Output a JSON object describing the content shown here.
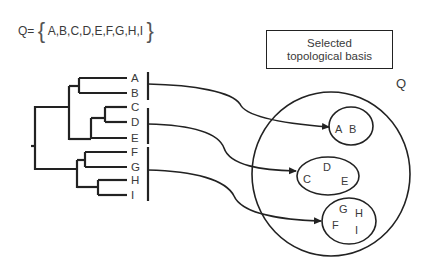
{
  "set_definition": {
    "symbol": "Q=",
    "elements": "A,B,C,D,E,F,G,H,I"
  },
  "basis_box": {
    "line1": "Selected",
    "line2": "topological basis"
  },
  "tree": {
    "leaves": [
      "A",
      "B",
      "C",
      "D",
      "E",
      "F",
      "G",
      "H",
      "I"
    ]
  },
  "space": {
    "label": "Q",
    "subsets": [
      {
        "members": [
          "A",
          "B"
        ]
      },
      {
        "members": [
          "C",
          "D",
          "E"
        ]
      },
      {
        "members": [
          "F",
          "G",
          "H",
          "I"
        ]
      }
    ]
  },
  "colors": {
    "stroke": "#222222",
    "text": "#3a3a3a"
  }
}
